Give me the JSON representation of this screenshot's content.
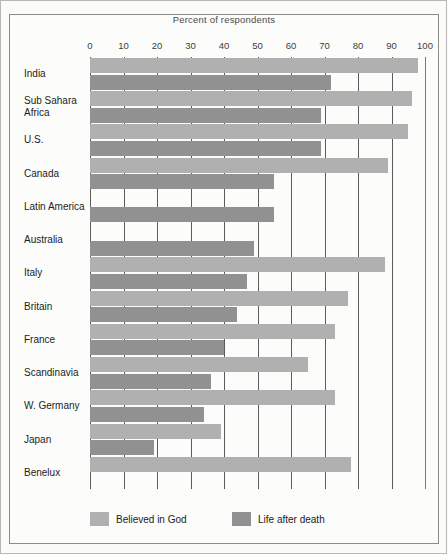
{
  "chart_data": {
    "type": "bar",
    "orientation": "horizontal",
    "title": "Percent of respondents",
    "xlabel": "Percent of respondents",
    "ylabel": "",
    "xlim": [
      0,
      100
    ],
    "xticks": [
      0,
      10,
      20,
      30,
      40,
      50,
      60,
      70,
      80,
      90,
      100
    ],
    "grid": true,
    "legend_position": "bottom",
    "categories": [
      "India",
      "Sub Sahara\nAfrica",
      "U.S.",
      "Canada",
      "Latin America",
      "Australia",
      "Italy",
      "Britain",
      "France",
      "Scandinavia",
      "W. Germany",
      "Japan",
      "Benelux"
    ],
    "series": [
      {
        "name": "Believed in God",
        "color": "#b0b0b0",
        "values": [
          98,
          96,
          95,
          89,
          null,
          null,
          88,
          77,
          73,
          65,
          73,
          39,
          78
        ]
      },
      {
        "name": "Life after death",
        "color": "#919191",
        "values": [
          72,
          69,
          69,
          55,
          55,
          49,
          47,
          44,
          40,
          36,
          34,
          19,
          null
        ]
      }
    ]
  },
  "legend": {
    "items": [
      {
        "label": "Believed in God",
        "swatch": "god"
      },
      {
        "label": "Life after death",
        "swatch": "afterlife"
      }
    ]
  }
}
